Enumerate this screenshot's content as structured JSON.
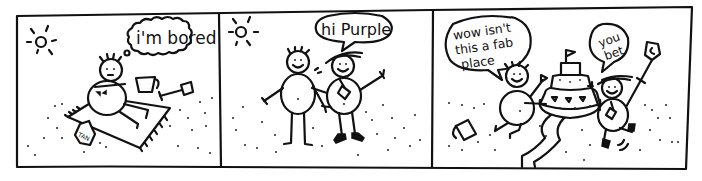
{
  "comic": {
    "panels": [
      {
        "id": 1,
        "scene": "stick figure lying on beach towel, sun, bucket and spade, tanning lotion",
        "bubble_type": "thought",
        "dialogue": "i'm bored",
        "props": {
          "lotion_label": "TAN"
        }
      },
      {
        "id": 2,
        "scene": "two stick figures greeting each other on the beach",
        "bubble_type": "speech",
        "dialogue": "hi Purple"
      },
      {
        "id": 3,
        "scene": "two figures jumping happily beside a sandcastle with a flag and a moat",
        "bubbles": [
          {
            "speaker": "left-figure",
            "bubble_type": "speech",
            "lines": [
              "wow isn't",
              "this a fab",
              "place"
            ]
          },
          {
            "speaker": "right-figure",
            "bubble_type": "speech",
            "lines": [
              "you",
              "bet"
            ]
          }
        ]
      }
    ],
    "colors": {
      "ink": "#111111",
      "paper": "#ffffff"
    }
  }
}
